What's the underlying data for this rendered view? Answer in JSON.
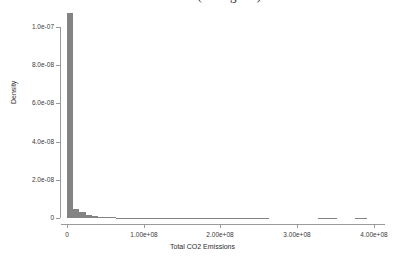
{
  "chart_data": {
    "type": "bar",
    "title": "KDE Distribution of CO2 Emission (Histogram)",
    "xlabel": "Total CO2 Emissions",
    "ylabel": "Density",
    "grid": false,
    "legend": null,
    "xlim": [
      -8000000,
      415000000
    ],
    "ylim": [
      0,
      1.08e-07
    ],
    "xticklabels": [
      "0",
      "1.00e+08",
      "2.00e+08",
      "3.00e+08",
      "4.00e+08"
    ],
    "xtickvalues": [
      0,
      100000000,
      200000000,
      300000000,
      400000000
    ],
    "yticklabels": [
      "0",
      "2.0e-08",
      "4.0e-08",
      "6.0e-08",
      "8.0e-08",
      "1.0e-07"
    ],
    "ytickvalues": [
      0,
      2e-08,
      4e-08,
      6e-08,
      8e-08,
      1e-07
    ],
    "bar_color": "#838383",
    "bin_width": 8000000,
    "bins": [
      {
        "x0": 0,
        "x1": 8000000,
        "density": 1.072e-07
      },
      {
        "x0": 8000000,
        "x1": 16000000,
        "density": 4.7e-09
      },
      {
        "x0": 16000000,
        "x1": 24000000,
        "density": 2.9e-09
      },
      {
        "x0": 24000000,
        "x1": 32000000,
        "density": 1.6e-09
      },
      {
        "x0": 32000000,
        "x1": 40000000,
        "density": 1e-09
      },
      {
        "x0": 40000000,
        "x1": 48000000,
        "density": 7e-10
      },
      {
        "x0": 48000000,
        "x1": 56000000,
        "density": 4.5e-10
      },
      {
        "x0": 56000000,
        "x1": 64000000,
        "density": 3e-10
      },
      {
        "x0": 64000000,
        "x1": 72000000,
        "density": 2.5e-10
      },
      {
        "x0": 72000000,
        "x1": 80000000,
        "density": 2e-10
      },
      {
        "x0": 80000000,
        "x1": 88000000,
        "density": 1.8e-10
      },
      {
        "x0": 88000000,
        "x1": 96000000,
        "density": 1.5e-10
      },
      {
        "x0": 96000000,
        "x1": 104000000,
        "density": 1.4e-10
      },
      {
        "x0": 104000000,
        "x1": 112000000,
        "density": 1.3e-10
      },
      {
        "x0": 112000000,
        "x1": 120000000,
        "density": 1.2e-10
      },
      {
        "x0": 120000000,
        "x1": 128000000,
        "density": 1.1e-10
      },
      {
        "x0": 128000000,
        "x1": 136000000,
        "density": 1.1e-10
      },
      {
        "x0": 136000000,
        "x1": 144000000,
        "density": 1e-10
      },
      {
        "x0": 144000000,
        "x1": 152000000,
        "density": 1e-10
      },
      {
        "x0": 152000000,
        "x1": 160000000,
        "density": 1e-10
      },
      {
        "x0": 160000000,
        "x1": 168000000,
        "density": 9.5e-11
      },
      {
        "x0": 168000000,
        "x1": 176000000,
        "density": 9.5e-11
      },
      {
        "x0": 176000000,
        "x1": 184000000,
        "density": 9e-11
      },
      {
        "x0": 184000000,
        "x1": 192000000,
        "density": 9e-11
      },
      {
        "x0": 192000000,
        "x1": 200000000,
        "density": 9e-11
      },
      {
        "x0": 200000000,
        "x1": 208000000,
        "density": 8.5e-11
      },
      {
        "x0": 208000000,
        "x1": 216000000,
        "density": 8.5e-11
      },
      {
        "x0": 216000000,
        "x1": 224000000,
        "density": 8.5e-11
      },
      {
        "x0": 224000000,
        "x1": 232000000,
        "density": 8e-11
      },
      {
        "x0": 232000000,
        "x1": 240000000,
        "density": 8e-11
      },
      {
        "x0": 240000000,
        "x1": 248000000,
        "density": 8e-11
      },
      {
        "x0": 248000000,
        "x1": 256000000,
        "density": 7.5e-11
      },
      {
        "x0": 256000000,
        "x1": 264000000,
        "density": 7e-11
      },
      {
        "x0": 328000000,
        "x1": 336000000,
        "density": 7e-11
      },
      {
        "x0": 336000000,
        "x1": 344000000,
        "density": 7e-11
      },
      {
        "x0": 344000000,
        "x1": 352000000,
        "density": 7e-11
      },
      {
        "x0": 376000000,
        "x1": 384000000,
        "density": 7e-11
      },
      {
        "x0": 384000000,
        "x1": 392000000,
        "density": 7e-11
      }
    ]
  }
}
